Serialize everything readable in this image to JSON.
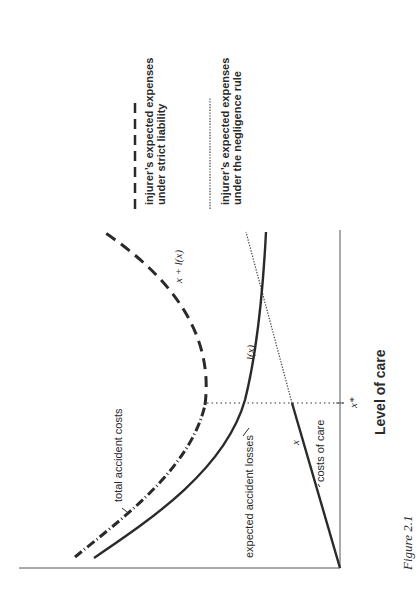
{
  "figure": {
    "caption": "Figure 2.1",
    "orientation": "rotated 90° counter-clockwise",
    "x_axis_label": "Level of care",
    "x_star_label": "x*",
    "curve_labels": {
      "total": "x + l(x)",
      "losses": "l(x)",
      "care": "x"
    },
    "annotations": {
      "total_accident_costs": "total accident costs",
      "expected_accident_losses": "expected accident losses",
      "costs_of_care": "costs of care"
    },
    "legend": [
      {
        "style": "dashed",
        "line1": "injurer’s expected expenses",
        "line2": "under strict liability"
      },
      {
        "style": "dotted",
        "line1": "injurer’s expected expenses",
        "line2": "under the negligence rule"
      }
    ],
    "colors": {
      "ink": "#2a2a2a",
      "axis": "#555555",
      "background": "#ffffff"
    }
  }
}
